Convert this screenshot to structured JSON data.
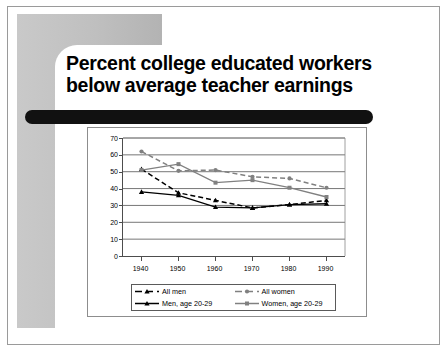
{
  "slide": {
    "title": "Percent college educated workers\nbelow average teacher earnings"
  },
  "colors": {
    "gray_block": "#c2c2c2",
    "accent_bar": "#111111",
    "series_black": "#000000",
    "series_gray": "#808080",
    "grid": "#666666",
    "frame": "#8d8d8d"
  },
  "chart_data": {
    "type": "line",
    "title": "",
    "xlabel": "",
    "ylabel": "",
    "categories": [
      "1940",
      "1950",
      "1960",
      "1970",
      "1980",
      "1990"
    ],
    "x": [
      1940,
      1950,
      1960,
      1970,
      1980,
      1990
    ],
    "ylim": [
      0,
      70
    ],
    "yticks": [
      0,
      10,
      20,
      30,
      40,
      50,
      60,
      70
    ],
    "ytick_labels": [
      "0",
      "10",
      "20",
      "30",
      "40",
      "50",
      "60",
      "70"
    ],
    "grid": true,
    "legend_position": "bottom",
    "series": [
      {
        "name": "All men",
        "values": [
          51.5,
          37.5,
          33.0,
          28.5,
          30.5,
          33.0
        ],
        "color": "#000000",
        "style": "dashed",
        "marker": "triangle"
      },
      {
        "name": "All women",
        "values": [
          62.0,
          50.5,
          51.0,
          47.0,
          46.0,
          40.5
        ],
        "color": "#808080",
        "style": "dashed",
        "marker": "circle"
      },
      {
        "name": "Men, age 20-29",
        "values": [
          38.0,
          36.0,
          29.0,
          28.5,
          30.5,
          31.0
        ],
        "color": "#000000",
        "style": "solid",
        "marker": "triangle"
      },
      {
        "name": "Women, age 20-29",
        "values": [
          51.0,
          54.5,
          43.5,
          45.0,
          40.5,
          35.0
        ],
        "color": "#808080",
        "style": "solid",
        "marker": "square"
      }
    ]
  }
}
